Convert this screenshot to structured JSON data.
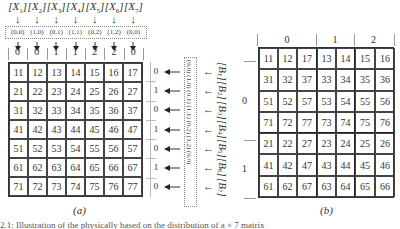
{
  "figure_a": {
    "caption": "(a)",
    "column_labels": [
      {
        "letter": "X",
        "index": "1"
      },
      {
        "letter": "X",
        "index": "2"
      },
      {
        "letter": "X",
        "index": "3"
      },
      {
        "letter": "X",
        "index": "4"
      },
      {
        "letter": "X",
        "index": "5"
      },
      {
        "letter": "X",
        "index": "6"
      },
      {
        "letter": "X",
        "index": "7"
      }
    ],
    "column_tuples": [
      "(0,0)",
      "(1,0)",
      "(0,1)",
      "(1,1)",
      "(0,2)",
      "(1,2)",
      "(0,0)"
    ],
    "column_owners": [
      "0",
      "0",
      "1",
      "1",
      "2",
      "2",
      "0"
    ],
    "matrix": [
      [
        "11",
        "12",
        "13",
        "14",
        "15",
        "16",
        "17"
      ],
      [
        "21",
        "22",
        "23",
        "24",
        "25",
        "26",
        "27"
      ],
      [
        "31",
        "32",
        "33",
        "34",
        "35",
        "36",
        "37"
      ],
      [
        "41",
        "42",
        "43",
        "44",
        "45",
        "46",
        "47"
      ],
      [
        "51",
        "52",
        "53",
        "54",
        "55",
        "56",
        "57"
      ],
      [
        "61",
        "62",
        "63",
        "64",
        "65",
        "66",
        "67"
      ],
      [
        "71",
        "72",
        "73",
        "74",
        "75",
        "76",
        "77"
      ]
    ],
    "row_owners": [
      "0",
      "1",
      "0",
      "1",
      "0",
      "1",
      "0"
    ],
    "row_tuples_text": "(0,0) (1,0) (0,1) (1,1) (0,2) (1,2) (0,0)",
    "row_labels_text": "[B1][B2][B3][B4][B5][B6][B7]",
    "row_labels": [
      {
        "letter": "B",
        "index": "1"
      },
      {
        "letter": "B",
        "index": "2"
      },
      {
        "letter": "B",
        "index": "3"
      },
      {
        "letter": "B",
        "index": "4"
      },
      {
        "letter": "B",
        "index": "5"
      },
      {
        "letter": "B",
        "index": "6"
      },
      {
        "letter": "B",
        "index": "7"
      }
    ]
  },
  "figure_b": {
    "caption": "(b)",
    "column_group_labels": [
      "0",
      "1",
      "2"
    ],
    "row_group_labels": [
      "0",
      "1"
    ],
    "matrix": [
      [
        "11",
        "12",
        "17",
        "13",
        "14",
        "15",
        "16"
      ],
      [
        "31",
        "32",
        "37",
        "33",
        "34",
        "35",
        "36"
      ],
      [
        "51",
        "52",
        "57",
        "53",
        "54",
        "55",
        "56"
      ],
      [
        "71",
        "72",
        "77",
        "73",
        "74",
        "75",
        "76"
      ],
      [
        "21",
        "22",
        "27",
        "23",
        "24",
        "25",
        "26"
      ],
      [
        "41",
        "42",
        "47",
        "43",
        "44",
        "45",
        "46"
      ],
      [
        "61",
        "62",
        "67",
        "63",
        "64",
        "65",
        "66"
      ]
    ]
  },
  "caption_fragment": "2.1: Illustration of the physically based on the distribution of a × 7 matrix"
}
